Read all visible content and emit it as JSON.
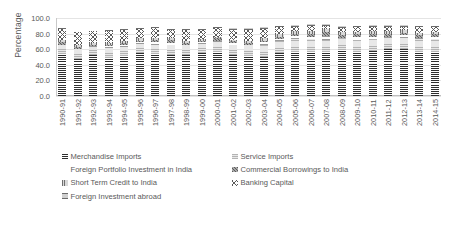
{
  "chart_data": {
    "type": "bar",
    "stacked": true,
    "title": "",
    "xlabel": "",
    "ylabel": "Percentage",
    "ylim": [
      0,
      100
    ],
    "ytick_labels": [
      "0.0",
      "20.0",
      "40.0",
      "60.0",
      "80.0",
      "100.0"
    ],
    "ytick_values": [
      0,
      20,
      40,
      60,
      80,
      100
    ],
    "grid": true,
    "legend_position": "bottom",
    "categories": [
      "1990-91",
      "1991-92",
      "1992-93",
      "1993-94",
      "1994-95",
      "1995-96",
      "1996-97",
      "1997-98",
      "1998-99",
      "1999-00",
      "2000-01",
      "2001-02",
      "2002-03",
      "2003-04",
      "2004-05",
      "2005-06",
      "2006-07",
      "2007-08",
      "2008-09",
      "2009-10",
      "2010-11",
      "2011-12",
      "2012-13",
      "2013-14",
      "2014-15"
    ],
    "series": [
      {
        "name": "Merchandise Imports",
        "color": "#2f2f2f",
        "values": [
          54.0,
          48.0,
          52.0,
          49.0,
          51.0,
          55.0,
          54.0,
          53.0,
          52.0,
          55.0,
          56.0,
          52.0,
          51.0,
          50.0,
          55.0,
          57.0,
          57.0,
          56.0,
          59.0,
          57.0,
          58.0,
          60.0,
          60.0,
          57.0,
          57.0
        ]
      },
      {
        "name": "Service Imports",
        "color": "#d3d3d3",
        "values": [
          11.0,
          12.0,
          11.0,
          12.0,
          12.0,
          12.0,
          12.0,
          13.0,
          13.0,
          12.0,
          13.0,
          14.0,
          14.0,
          15.0,
          15.0,
          16.0,
          16.0,
          16.0,
          15.0,
          15.0,
          15.0,
          14.0,
          15.0,
          16.0,
          16.0
        ]
      },
      {
        "name": "Foreign Portfolio Investment in India",
        "color": "#f2f2f2",
        "values": [
          0.5,
          0.5,
          1.0,
          3.0,
          3.0,
          2.0,
          3.0,
          2.0,
          0.5,
          2.0,
          2.0,
          2.0,
          1.0,
          4.0,
          3.0,
          4.0,
          3.0,
          5.0,
          0.5,
          4.0,
          3.0,
          2.0,
          3.0,
          2.0,
          3.0
        ]
      },
      {
        "name": "Commercial Borrowings to India",
        "color": "#8c8c8c",
        "values": [
          4.0,
          3.0,
          2.0,
          2.0,
          2.0,
          2.0,
          3.0,
          4.0,
          3.0,
          2.0,
          3.0,
          2.0,
          2.0,
          2.0,
          3.0,
          3.0,
          4.0,
          5.0,
          4.0,
          3.0,
          4.0,
          4.0,
          3.0,
          3.0,
          3.0
        ]
      },
      {
        "name": "Short Term Credit to India",
        "color": "#bdbdbd",
        "values": [
          3.0,
          2.0,
          2.0,
          2.0,
          3.0,
          3.0,
          3.0,
          2.0,
          2.0,
          2.0,
          2.0,
          2.0,
          3.0,
          3.0,
          4.0,
          4.0,
          4.0,
          4.0,
          3.0,
          3.0,
          4.0,
          4.0,
          4.0,
          3.0,
          3.0
        ]
      },
      {
        "name": "Banking Capital",
        "color": "#5a5a5a",
        "values": [
          14.0,
          16.0,
          15.0,
          16.0,
          14.0,
          12.0,
          12.0,
          11.0,
          14.0,
          12.0,
          11.0,
          13.0,
          14.0,
          12.0,
          8.0,
          5.0,
          6.0,
          4.0,
          6.0,
          6.0,
          5.0,
          5.0,
          4.0,
          7.0,
          6.0
        ]
      },
      {
        "name": "Foreign Investment abroad",
        "color": "#a6a6a6",
        "values": [
          1.0,
          1.0,
          1.0,
          1.0,
          1.0,
          1.0,
          1.0,
          1.0,
          1.0,
          1.0,
          1.0,
          2.0,
          2.0,
          2.0,
          2.0,
          2.0,
          3.0,
          3.0,
          2.0,
          2.0,
          2.0,
          2.0,
          2.0,
          2.0,
          2.0
        ]
      }
    ]
  },
  "legend": {
    "rows": [
      [
        {
          "label": "Merchandise Imports",
          "pattern": "p-merch"
        },
        {
          "label": "Service Imports",
          "pattern": "p-service"
        }
      ],
      [
        {
          "label": "Foreign Portfolio Investment in India",
          "pattern": "p-fpi"
        },
        {
          "label": "Commercial Borrowings to India",
          "pattern": "p-cb"
        }
      ],
      [
        {
          "label": "Short Term Credit to India",
          "pattern": "p-stc"
        },
        {
          "label": "Banking Capital",
          "pattern": "p-bank"
        }
      ],
      [
        {
          "label": "Foreign Investment abroad",
          "pattern": "p-fia"
        }
      ]
    ]
  }
}
